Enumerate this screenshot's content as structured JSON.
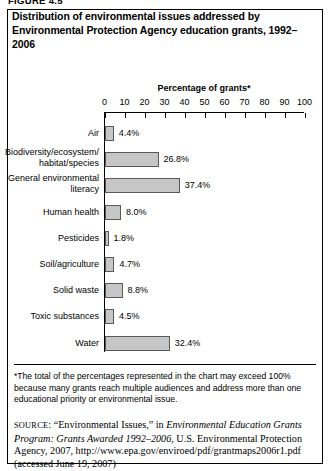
{
  "figure": {
    "label": "FIGURE 4.5",
    "title": "Distribution of environmental issues addressed by Environmental Protection Agency education grants, 1992–2006"
  },
  "footnote": "*The total of the percentages represented in the chart may exceed 100% because many grants reach multiple audiences and address more than one educational priority or environmental issue.",
  "source": {
    "prefix": "SOURCE",
    "part1": ": “Environmental Issues,” in ",
    "italic1": "Environmental Education Grants Program: Grants Awarded 1992–2006",
    "part2": ", U.S. Environmental Protection Agency, 2007, http://www.epa.gov/enviroed/pdf/grantmaps2006r1.pdf (accessed June 19, 2007)"
  },
  "colors": {
    "bar_fill": "#c6c6c6",
    "bar_stroke": "#595959",
    "axis": "#000000",
    "background": "#ffffff"
  },
  "chart_data": {
    "type": "bar",
    "orientation": "horizontal",
    "title": "Distribution of environmental issues addressed by Environmental Protection Agency education grants, 1992–2006",
    "xlabel": "Percentage of grants*",
    "ylabel": "",
    "xlim": [
      0,
      100
    ],
    "xticks": [
      0,
      10,
      20,
      30,
      40,
      50,
      60,
      70,
      80,
      90,
      100
    ],
    "grid": false,
    "legend": false,
    "categories": [
      "Air",
      "Biodiversity/ecosystem/ habitat/species",
      "General environmental literacy",
      "Human health",
      "Pesticides",
      "Soil/agriculture",
      "Solid waste",
      "Toxic substances",
      "Water"
    ],
    "values": [
      4.4,
      26.8,
      37.4,
      8.0,
      1.8,
      4.7,
      8.8,
      4.5,
      32.4
    ],
    "value_labels": [
      "4.4%",
      "26.8%",
      "37.4%",
      "8.0%",
      "1.8%",
      "4.7%",
      "8.8%",
      "4.5%",
      "32.4%"
    ]
  }
}
